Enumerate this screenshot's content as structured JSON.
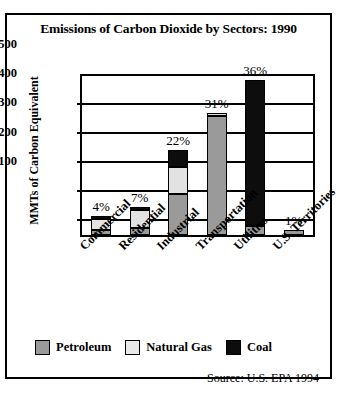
{
  "chart_data": {
    "type": "bar",
    "subtype": "stacked-bar",
    "title": "Emissions of Carbon Dioxide by Sectors: 1990",
    "xlabel": "",
    "ylabel": "MMTs of Carbon Equivalent",
    "ylim": [
      0,
      560
    ],
    "yticks": [
      100,
      200,
      300,
      400,
      500
    ],
    "grid": true,
    "legend_position": "bottom-left",
    "source": "Source: U.S. EPA 1994",
    "categories": [
      "Commercial",
      "Residential",
      "Industrial",
      "Transportation",
      "Utilities",
      "U.S. Territories"
    ],
    "series": [
      {
        "name": "Petroleum",
        "color": "#9a9a9a",
        "values": [
          18,
          26,
          143,
          420,
          30,
          16
        ]
      },
      {
        "name": "Natural Gas",
        "color": "#e2e2e2",
        "values": [
          38,
          62,
          95,
          8,
          5,
          0
        ]
      },
      {
        "name": "Coal",
        "color": "#0d0d0d",
        "values": [
          10,
          10,
          62,
          0,
          510,
          0
        ]
      }
    ],
    "totals": [
      66,
      98,
      300,
      428,
      545,
      16
    ],
    "data_labels": [
      "4%",
      "7%",
      "22%",
      "31%",
      "36%",
      "1%"
    ]
  },
  "legend": [
    {
      "label": "Petroleum",
      "swatch": "pet"
    },
    {
      "label": "Natural Gas",
      "swatch": "gas"
    },
    {
      "label": "Coal",
      "swatch": "coal"
    }
  ]
}
